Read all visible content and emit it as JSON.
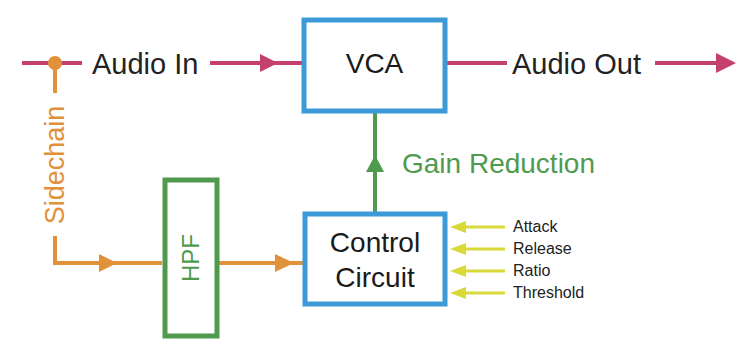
{
  "diagram": {
    "colors": {
      "audio_path": "#c4406e",
      "sidechain_path": "#e0913a",
      "gain_reduction": "#4f9a4f",
      "hpf_border": "#4f9a4f",
      "block_border": "#3d9ad8",
      "param_arrow": "#d9d93a"
    },
    "signals": {
      "audio_in": "Audio In",
      "audio_out": "Audio Out",
      "sidechain": "Sidechain",
      "gain_reduction": "Gain Reduction"
    },
    "blocks": {
      "vca": "VCA",
      "hpf": "HPF",
      "control_line1": "Control",
      "control_line2": "Circuit"
    },
    "parameters": [
      "Attack",
      "Release",
      "Ratio",
      "Threshold"
    ]
  }
}
